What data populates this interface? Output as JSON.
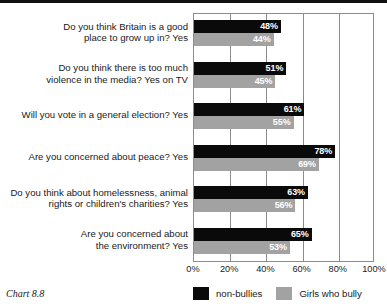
{
  "caption": "Chart 8.8",
  "chart_data": {
    "type": "bar",
    "orientation": "horizontal",
    "title": "",
    "xlabel": "",
    "ylabel": "",
    "xlim": [
      0,
      100
    ],
    "xticks": [
      "0%",
      "20%",
      "40%",
      "60%",
      "80%",
      "100%"
    ],
    "xtick_values": [
      0,
      20,
      40,
      60,
      80,
      100
    ],
    "grid": true,
    "legend_position": "bottom",
    "categories": [
      "Do you think Britain is a good place to grow up in? Yes",
      "Do you think there is too much violence in the media? Yes on TV",
      "Will you vote in a general election? Yes",
      "Are you concerned about peace? Yes",
      "Do you think about homelessness, animal rights or children's charities? Yes",
      "Are you concerned about the environment? Yes"
    ],
    "category_lines": [
      [
        "Do you think Britain is a good",
        "place to grow up in? Yes"
      ],
      [
        "Do you think there is too much",
        "violence in the media? Yes on TV"
      ],
      [
        "Will you vote in a general election? Yes"
      ],
      [
        "Are you concerned about peace? Yes"
      ],
      [
        "Do you think about homelessness, animal",
        "rights or children's charities? Yes"
      ],
      [
        "Are you concerned about",
        "the environment? Yes"
      ]
    ],
    "series": [
      {
        "name": "non-bullies",
        "color": "#0a0a0a",
        "values": [
          48,
          51,
          61,
          78,
          63,
          65
        ],
        "labels": [
          "48%",
          "51%",
          "61%",
          "78%",
          "63%",
          "65%"
        ]
      },
      {
        "name": "Girls who bully",
        "color": "#a2a2a2",
        "values": [
          44,
          45,
          55,
          69,
          56,
          53
        ],
        "labels": [
          "44%",
          "45%",
          "55%",
          "69%",
          "56%",
          "53%"
        ]
      }
    ]
  }
}
